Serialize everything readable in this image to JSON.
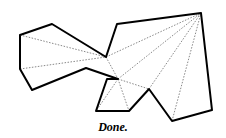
{
  "diagram": {
    "caption": "Done.",
    "polygon": [
      [
        20,
        35
      ],
      [
        52,
        24
      ],
      [
        106,
        57
      ],
      [
        117,
        24
      ],
      [
        201,
        13
      ],
      [
        212,
        110
      ],
      [
        172,
        121
      ],
      [
        149,
        89
      ],
      [
        129,
        111
      ],
      [
        96,
        111
      ],
      [
        107,
        79
      ],
      [
        118,
        79
      ],
      [
        86,
        68
      ],
      [
        32,
        90
      ],
      [
        20,
        69
      ]
    ],
    "diagonals": [
      [
        [
          20,
          35
        ],
        [
          106,
          57
        ]
      ],
      [
        [
          20,
          69
        ],
        [
          106,
          57
        ]
      ],
      [
        [
          106,
          57
        ],
        [
          201,
          13
        ]
      ],
      [
        [
          106,
          57
        ],
        [
          118,
          79
        ]
      ],
      [
        [
          118,
          79
        ],
        [
          201,
          13
        ]
      ],
      [
        [
          118,
          79
        ],
        [
          149,
          89
        ]
      ],
      [
        [
          149,
          89
        ],
        [
          201,
          13
        ]
      ],
      [
        [
          172,
          121
        ],
        [
          201,
          13
        ]
      ],
      [
        [
          118,
          79
        ],
        [
          96,
          111
        ]
      ],
      [
        [
          118,
          79
        ],
        [
          129,
          111
        ]
      ]
    ],
    "colors": {
      "edge": "#000000",
      "diagonal": "#555555"
    }
  }
}
